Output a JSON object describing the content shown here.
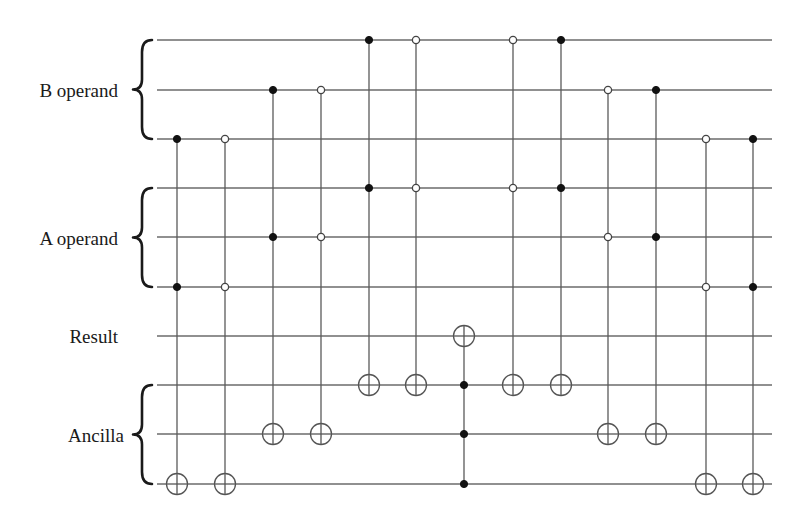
{
  "diagram": {
    "type": "quantum-circuit",
    "wire_span": [
      157,
      772
    ],
    "wires_y": [
      40,
      90,
      139,
      188,
      237,
      287,
      336,
      385,
      434,
      484
    ],
    "groups": [
      {
        "label": "B operand",
        "wires": [
          0,
          1,
          2
        ],
        "label_x": 118,
        "label_y": 97
      },
      {
        "label": "A operand",
        "wires": [
          3,
          4,
          5
        ],
        "label_x": 118,
        "label_y": 245
      },
      {
        "label": "Result",
        "wires": [
          6
        ],
        "label_x": 118,
        "label_y": 343,
        "no_brace": true
      },
      {
        "label": "Ancilla",
        "wires": [
          7,
          8,
          9
        ],
        "label_x": 124,
        "label_y": 442
      }
    ],
    "gates": [
      {
        "x": 177,
        "controls": [
          {
            "wire": 2,
            "type": "filled"
          },
          {
            "wire": 5,
            "type": "filled"
          }
        ],
        "target": 9
      },
      {
        "x": 225,
        "controls": [
          {
            "wire": 2,
            "type": "open"
          },
          {
            "wire": 5,
            "type": "open"
          }
        ],
        "target": 9
      },
      {
        "x": 273,
        "controls": [
          {
            "wire": 1,
            "type": "filled"
          },
          {
            "wire": 4,
            "type": "filled"
          }
        ],
        "target": 8
      },
      {
        "x": 321,
        "controls": [
          {
            "wire": 1,
            "type": "open"
          },
          {
            "wire": 4,
            "type": "open"
          }
        ],
        "target": 8
      },
      {
        "x": 369,
        "controls": [
          {
            "wire": 0,
            "type": "filled"
          },
          {
            "wire": 3,
            "type": "filled"
          }
        ],
        "target": 7
      },
      {
        "x": 416,
        "controls": [
          {
            "wire": 0,
            "type": "open"
          },
          {
            "wire": 3,
            "type": "open"
          }
        ],
        "target": 7
      },
      {
        "x": 464,
        "controls": [
          {
            "wire": 7,
            "type": "filled"
          },
          {
            "wire": 8,
            "type": "filled"
          },
          {
            "wire": 9,
            "type": "filled"
          }
        ],
        "target": 6
      },
      {
        "x": 513,
        "controls": [
          {
            "wire": 0,
            "type": "open"
          },
          {
            "wire": 3,
            "type": "open"
          }
        ],
        "target": 7
      },
      {
        "x": 561,
        "controls": [
          {
            "wire": 0,
            "type": "filled"
          },
          {
            "wire": 3,
            "type": "filled"
          }
        ],
        "target": 7
      },
      {
        "x": 608,
        "controls": [
          {
            "wire": 1,
            "type": "open"
          },
          {
            "wire": 4,
            "type": "open"
          }
        ],
        "target": 8
      },
      {
        "x": 656,
        "controls": [
          {
            "wire": 1,
            "type": "filled"
          },
          {
            "wire": 4,
            "type": "filled"
          }
        ],
        "target": 8
      },
      {
        "x": 706,
        "controls": [
          {
            "wire": 2,
            "type": "open"
          },
          {
            "wire": 5,
            "type": "open"
          }
        ],
        "target": 9
      },
      {
        "x": 753,
        "controls": [
          {
            "wire": 2,
            "type": "filled"
          },
          {
            "wire": 5,
            "type": "filled"
          }
        ],
        "target": 9
      }
    ],
    "colors": {
      "wire": "#6b6b6b",
      "control_filled": "#111111",
      "control_open_fill": "#ffffff",
      "text": "#1a1a1a"
    }
  }
}
